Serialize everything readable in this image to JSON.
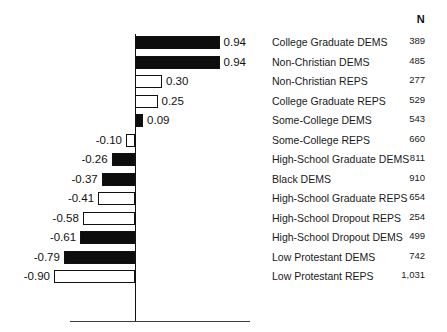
{
  "header": {
    "n_label": "N"
  },
  "chart_data": {
    "type": "bar",
    "orientation": "horizontal",
    "title": "",
    "xlabel": "",
    "ylabel": "",
    "xlim": [
      -1.0,
      1.0
    ],
    "zero_line": true,
    "grid": false,
    "legend": "none",
    "value_column_header": "N",
    "categories": [
      "College Graduate DEMS",
      "Non-Christian DEMS",
      "Non-Christian REPS",
      "College Graduate REPS",
      "Some-College DEMS",
      "Some-College REPS",
      "High-School Graduate DEMS",
      "Black DEMS",
      "High-School Graduate REPS",
      "High-School Dropout REPS",
      "High-School Dropout DEMS",
      "Low Protestant DEMS",
      "Low Protestant REPS"
    ],
    "values": [
      0.94,
      0.94,
      0.3,
      0.25,
      0.09,
      -0.1,
      -0.26,
      -0.37,
      -0.41,
      -0.58,
      -0.61,
      -0.79,
      -0.9
    ],
    "value_labels": [
      "0.94",
      "0.94",
      "0.30",
      "0.25",
      "0.09",
      "-0.10",
      "-0.26",
      "-0.37",
      "-0.41",
      "-0.58",
      "-0.61",
      "-0.79",
      "-0.90"
    ],
    "n_values": [
      389,
      485,
      277,
      529,
      543,
      660,
      811,
      910,
      654,
      254,
      499,
      742,
      1031
    ],
    "n_labels": [
      "389",
      "485",
      "277",
      "529",
      "543",
      "660",
      "811",
      "910",
      "654",
      "254",
      "499",
      "742",
      "1,031"
    ],
    "fills": [
      "dark",
      "dark",
      "light",
      "light",
      "dark",
      "light",
      "dark",
      "dark",
      "light",
      "light",
      "dark",
      "dark",
      "light"
    ],
    "colors": {
      "dark_fill": "#0d0d0d",
      "light_fill": "#ffffff",
      "outline": "#111111",
      "axis": "#111111",
      "baseline": "#3d3d3d",
      "text": "#1a1a1a"
    }
  }
}
